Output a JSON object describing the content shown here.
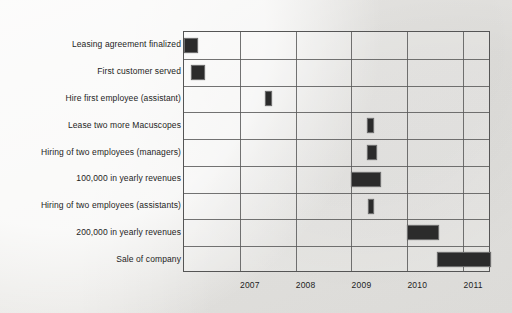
{
  "chart_data": {
    "type": "bar",
    "subtype": "gantt",
    "title": "",
    "xlabel": "",
    "ylabel": "",
    "grid": true,
    "legend": null,
    "xlim": [
      2006.0,
      2011.5
    ],
    "x_ticks": [
      2007,
      2008,
      2009,
      2010,
      2011
    ],
    "x_tick_labels": [
      "2007",
      "2008",
      "2009",
      "2010",
      "2011"
    ],
    "categories": [
      "Leasing agreement finalized",
      "First customer served",
      "Hire first employee (assistant)",
      "Lease two more Macuscopes",
      "Hiring of two employees (managers)",
      "100,000 in yearly revenues",
      "Hiring of two employees (assistants)",
      "200,000 in yearly revenues",
      "Sale of company"
    ],
    "tasks": [
      {
        "label": "Leasing agreement finalized",
        "start": 2006.0,
        "end": 2006.25
      },
      {
        "label": "First customer served",
        "start": 2006.12,
        "end": 2006.37
      },
      {
        "label": "Hire first employee (assistant)",
        "start": 2007.45,
        "end": 2007.58
      },
      {
        "label": "Lease two more Macuscopes",
        "start": 2009.27,
        "end": 2009.4
      },
      {
        "label": "Hiring of two employees (managers)",
        "start": 2009.27,
        "end": 2009.45
      },
      {
        "label": "100,000 in yearly revenues",
        "start": 2009.0,
        "end": 2009.53
      },
      {
        "label": "Hiring of two employees (assistants)",
        "start": 2009.3,
        "end": 2009.4
      },
      {
        "label": "200,000 in yearly revenues",
        "start": 2010.0,
        "end": 2010.57
      },
      {
        "label": "Sale of company",
        "start": 2010.53,
        "end": 2011.5
      }
    ],
    "bar_color": "#2b2b2b",
    "background_color": "#eeedeb",
    "axis_color": "#555555"
  }
}
